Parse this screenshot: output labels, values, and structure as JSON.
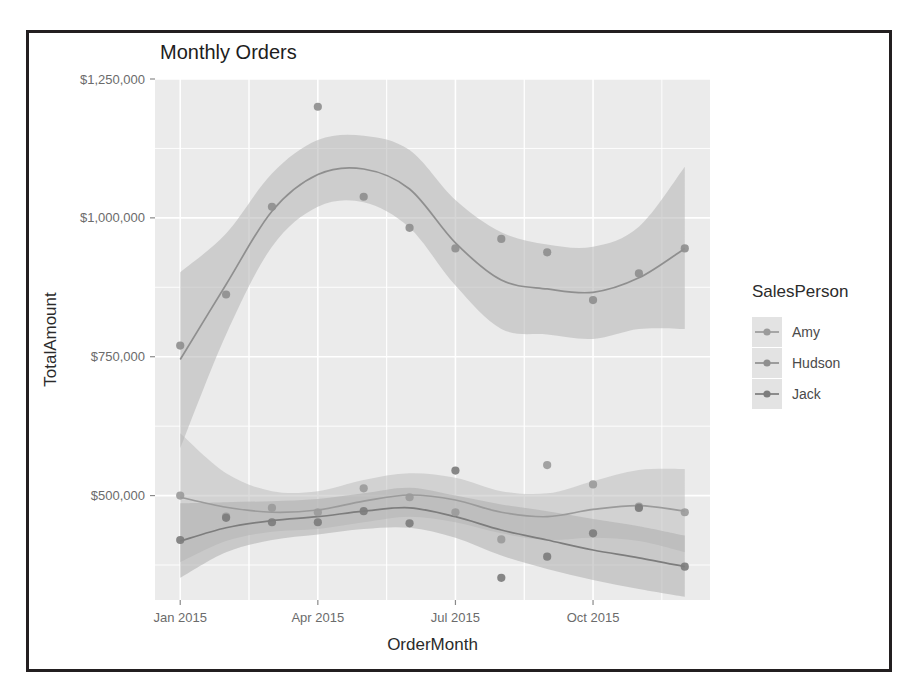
{
  "chart_data": {
    "type": "line",
    "title": "Monthly Orders",
    "xlabel": "OrderMonth",
    "ylabel": "TotalAmount",
    "grid": true,
    "legend_position": "right",
    "legend_title": "SalesPerson",
    "xtick_labels": [
      "Jan 2015",
      "Apr 2015",
      "Jul 2015",
      "Oct 2015"
    ],
    "xtick_months": [
      1,
      4,
      7,
      10
    ],
    "ytick_labels": [
      "$1,250,000",
      "$1,000,000",
      "$750,000",
      "$500,000"
    ],
    "ytick_values": [
      1250000,
      1000000,
      750000,
      500000
    ],
    "xlim_months": [
      0.45,
      12.55
    ],
    "ylim": [
      312000,
      1250000
    ],
    "x": [
      "Jan 2015",
      "Feb 2015",
      "Mar 2015",
      "Apr 2015",
      "May 2015",
      "Jun 2015",
      "Jul 2015",
      "Aug 2015",
      "Sep 2015",
      "Oct 2015",
      "Nov 2015",
      "Dec 2015"
    ],
    "has_smooth_fit": true,
    "has_confidence_band": true,
    "series": [
      {
        "name": "Amy",
        "color": "#9b9b9b",
        "band_color": "#bdbdbd",
        "values": [
          500000,
          462000,
          478000,
          470000,
          513000,
          497000,
          470000,
          421000,
          555000,
          520000,
          480000,
          470000
        ],
        "fit": [
          497000,
          479000,
          470000,
          474000,
          490000,
          501000,
          492000,
          470000,
          462000,
          475000,
          482000,
          472000
        ],
        "band_low": [
          380000,
          418000,
          435000,
          440000,
          452000,
          462000,
          452000,
          432000,
          420000,
          424000,
          418000,
          398000
        ],
        "band_high": [
          612000,
          540000,
          508000,
          508000,
          528000,
          540000,
          532000,
          508000,
          504000,
          526000,
          546000,
          548000
        ]
      },
      {
        "name": "Hudson",
        "color": "#8f8f8f",
        "band_color": "#b5b5b5",
        "values": [
          770000,
          862000,
          1020000,
          1200000,
          1038000,
          982000,
          945000,
          962000,
          938000,
          852000,
          900000,
          945000
        ],
        "fit": [
          745000,
          880000,
          1012000,
          1078000,
          1088000,
          1052000,
          955000,
          888000,
          872000,
          866000,
          892000,
          945000
        ],
        "band_low": [
          585000,
          790000,
          948000,
          1020000,
          1028000,
          982000,
          878000,
          800000,
          790000,
          782000,
          800000,
          800000
        ],
        "band_high": [
          902000,
          972000,
          1080000,
          1140000,
          1148000,
          1122000,
          1032000,
          974000,
          952000,
          948000,
          984000,
          1092000
        ]
      },
      {
        "name": "Jack",
        "color": "#7d7d7d",
        "band_color": "#adadad",
        "values": [
          420000,
          460000,
          452000,
          452000,
          472000,
          450000,
          545000,
          352000,
          390000,
          432000,
          478000,
          372000
        ],
        "fit": [
          418000,
          442000,
          455000,
          462000,
          472000,
          478000,
          462000,
          438000,
          420000,
          402000,
          388000,
          372000
        ],
        "band_low": [
          352000,
          398000,
          420000,
          430000,
          440000,
          442000,
          424000,
          392000,
          368000,
          348000,
          332000,
          318000
        ],
        "band_high": [
          486000,
          488000,
          490000,
          494000,
          504000,
          514000,
          500000,
          484000,
          472000,
          458000,
          445000,
          428000
        ]
      }
    ]
  }
}
